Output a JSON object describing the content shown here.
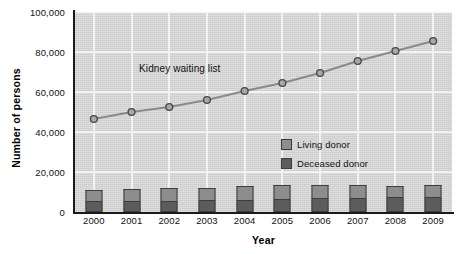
{
  "chart_data": {
    "type": "bar",
    "title": "",
    "subtitle": "",
    "xlabel": "Year",
    "ylabel": "Number of persons",
    "categories": [
      "2000",
      "2001",
      "2002",
      "2003",
      "2004",
      "2005",
      "2006",
      "2007",
      "2008",
      "2009"
    ],
    "ylim": [
      0,
      100000
    ],
    "ytick_labels": [
      "0",
      "20,000",
      "40,000",
      "60,000",
      "80,000",
      "100,000"
    ],
    "ytick_values": [
      0,
      20000,
      40000,
      60000,
      80000,
      100000
    ],
    "grid": true,
    "grid_axis": "both",
    "legend_position": "inside-center-right",
    "bar_mode": "stacked",
    "series": [
      {
        "name": "Kidney waiting list",
        "type": "line",
        "marker": "circle",
        "color": "#8a8a8a",
        "values": [
          46500,
          50000,
          52500,
          56000,
          60500,
          64500,
          69500,
          75500,
          80500,
          85500
        ]
      },
      {
        "name": "Deceased donor",
        "type": "bar",
        "color": "#5c5c5c",
        "values": [
          5500,
          5600,
          5700,
          5800,
          6200,
          6700,
          7000,
          7000,
          7300,
          7300
        ]
      },
      {
        "name": "Living donor",
        "type": "bar",
        "color": "#8d8d8d",
        "values": [
          5500,
          6000,
          6300,
          6400,
          6800,
          6800,
          6700,
          6600,
          5900,
          6400
        ]
      }
    ],
    "annotations": [
      {
        "text": "Kidney waiting list",
        "x": 1.2,
        "y": 71000
      }
    ]
  },
  "axes": {
    "x_title": "Year",
    "y_title": "Number of persons"
  },
  "legend": {
    "items": [
      {
        "label": "Living donor",
        "color": "#8d8d8d"
      },
      {
        "label": "Deceased donor",
        "color": "#5c5c5c"
      }
    ]
  },
  "colors": {
    "plot_background": "#d2d2d2",
    "grid": "#f2f2f2",
    "axis": "#1a1a1a",
    "line": "#8a8a8a",
    "marker_fill": "#a8a8a8",
    "marker_stroke": "#4a4a4a",
    "living_donor": "#8d8d8d",
    "deceased_donor": "#5c5c5c",
    "bar_outline": "#3d3d3d",
    "text": "#111111"
  }
}
